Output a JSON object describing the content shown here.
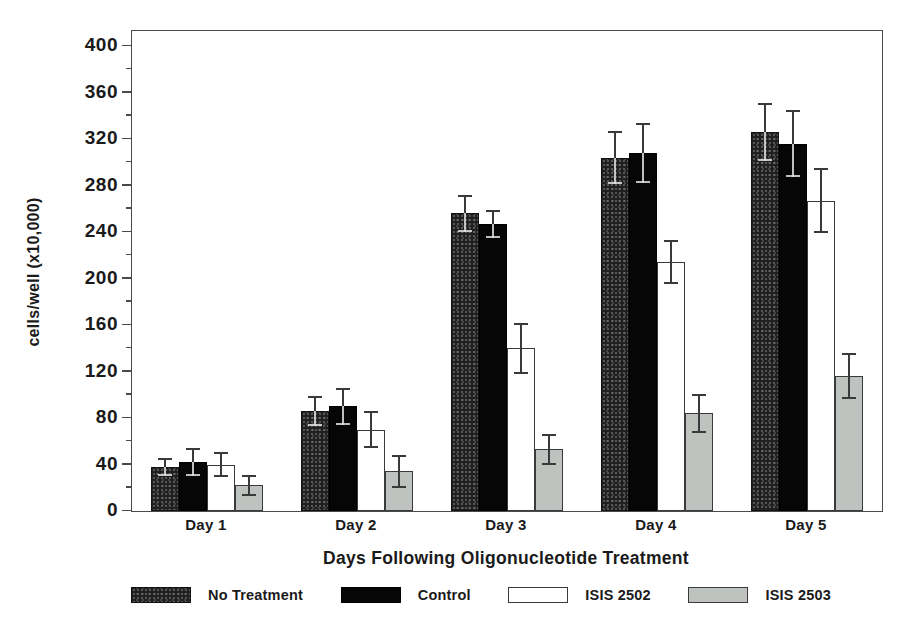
{
  "chart_data": {
    "type": "bar",
    "title": "",
    "xlabel": "Days Following Oligonucleotide Treatment",
    "ylabel": "cells/well (x10,000)",
    "ylim": [
      0,
      400
    ],
    "y_major_step": 40,
    "y_minor_step": 20,
    "grid": false,
    "error_bars": true,
    "legend_position": "bottom",
    "axis_color": "#4a4a4a",
    "categories": [
      "Day 1",
      "Day 2",
      "Day 3",
      "Day 4",
      "Day 5"
    ],
    "series": [
      {
        "name": "No Treatment",
        "pattern": "speckled-dark",
        "fill": "#202020",
        "dark": true,
        "values": [
          38,
          86,
          256,
          304,
          326
        ],
        "errors": [
          8,
          13,
          16,
          23,
          25
        ]
      },
      {
        "name": "Control",
        "pattern": "solid-black",
        "fill": "#060606",
        "dark": true,
        "values": [
          42,
          90,
          247,
          308,
          316
        ],
        "errors": [
          12,
          16,
          12,
          26,
          29
        ]
      },
      {
        "name": "ISIS 2502",
        "pattern": "outlined-white",
        "fill": "#ffffff",
        "dark": false,
        "values": [
          40,
          70,
          140,
          214,
          267
        ],
        "errors": [
          11,
          16,
          22,
          19,
          28
        ]
      },
      {
        "name": "ISIS 2503",
        "pattern": "outlined-gray",
        "fill": "#bfc3bf",
        "dark": false,
        "values": [
          22,
          34,
          53,
          84,
          116
        ],
        "errors": [
          9,
          14,
          13,
          17,
          20
        ]
      }
    ]
  }
}
